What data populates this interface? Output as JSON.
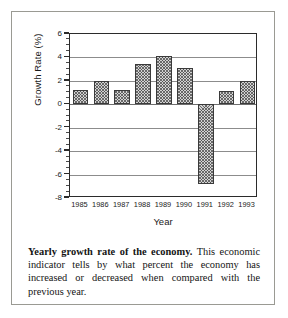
{
  "figure": {
    "caption_lead": "Yearly growth rate of the economy.",
    "caption_body": " This economic indicator tells by what percent the economy has increased or decreased when compared with the previous year."
  },
  "chart_data": {
    "type": "bar",
    "title": "",
    "xlabel": "Year",
    "ylabel": "Growth Rate (%)",
    "categories": [
      "1985",
      "1986",
      "1987",
      "1988",
      "1989",
      "1990",
      "1991",
      "1992",
      "1993"
    ],
    "values": [
      1.2,
      2.0,
      1.2,
      3.4,
      4.1,
      3.1,
      -6.8,
      1.1,
      2.0
    ],
    "ylim": [
      -8,
      6
    ],
    "ytick_labels": [
      "6",
      "4",
      "2",
      "0",
      "-2",
      "-4",
      "-6",
      "-8"
    ],
    "ytick_values": [
      6,
      4,
      2,
      0,
      -2,
      -4,
      -6,
      -8
    ],
    "yminor_step": 0.5,
    "grid": true,
    "legend": "none",
    "bar_fill": "#d2d2d2",
    "bar_edge": "#3a3a3a",
    "axis_color": "#2b2b2b"
  }
}
